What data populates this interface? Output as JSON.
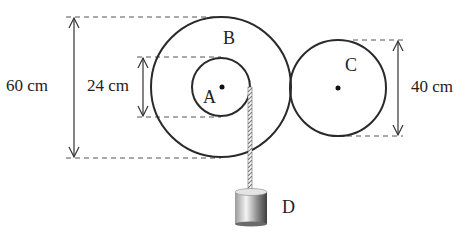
{
  "diagram": {
    "type": "pulley-system",
    "colors": {
      "stroke": "#2a2a2a",
      "dashed": "#555555",
      "weight_light": "#f0f0f0",
      "weight_dark": "#555555"
    },
    "labels": {
      "pulley_a": "A",
      "pulley_b": "B",
      "pulley_c": "C",
      "weight_d": "D"
    },
    "dimensions": {
      "b_diameter": "60 cm",
      "a_diameter": "24 cm",
      "c_diameter": "40 cm"
    }
  }
}
